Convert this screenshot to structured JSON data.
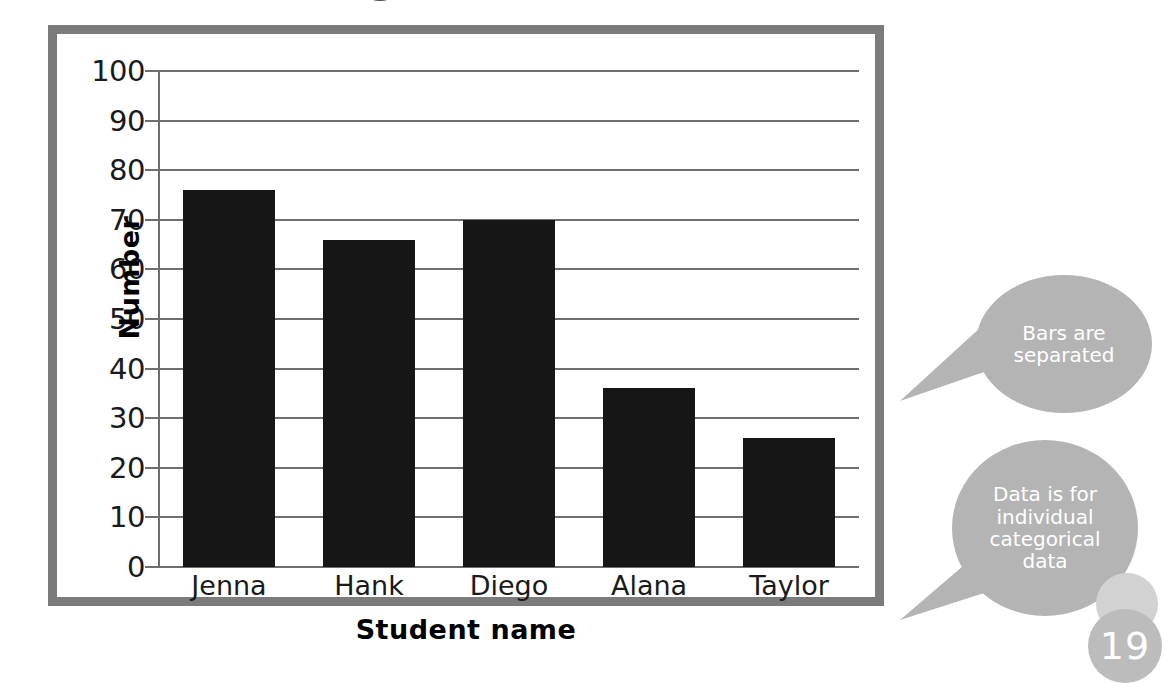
{
  "chart_data": {
    "type": "bar",
    "title": "",
    "categories": [
      "Jenna",
      "Hank",
      "Diego",
      "Alana",
      "Taylor"
    ],
    "values": [
      76,
      66,
      70,
      36,
      26
    ],
    "xlabel": "Student name",
    "ylabel": "Number",
    "ylim": [
      0,
      100
    ],
    "ytick_step": 10,
    "yticks": [
      "100",
      "90",
      "80",
      "70",
      "60",
      "50",
      "40",
      "30",
      "20",
      "10",
      "0"
    ],
    "grid": "horizontal",
    "legend": "none",
    "bar_color": "#161616",
    "gridline_color": "#6e6e6e",
    "frame_color": "#7b7b7b",
    "annotations": [
      "Bars are separated",
      "Data is for individual categorical data"
    ]
  },
  "axes": {
    "y_title": "Number",
    "x_title": "Student name"
  },
  "callouts": [
    {
      "id": "bars-separated",
      "lines": [
        "Bars are",
        "separated"
      ],
      "color": "#b4b4b4"
    },
    {
      "id": "categorical-data",
      "lines": [
        "Data is for",
        "individual",
        "categorical",
        "data"
      ],
      "color": "#b4b4b4"
    }
  ],
  "page": {
    "number": "19",
    "badge_color": "#bcbcbc"
  },
  "title_remnant": ""
}
